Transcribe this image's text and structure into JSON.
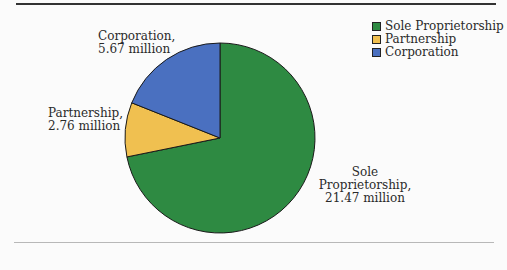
{
  "chart_data": {
    "type": "pie",
    "title": "",
    "categories": [
      "Sole Proprietorship",
      "Partnership",
      "Corporation"
    ],
    "values": [
      21.47,
      2.76,
      5.67
    ],
    "units": "million",
    "colors": [
      "#2e8a42",
      "#f0c050",
      "#4a70c0"
    ],
    "legend_position": "top-right",
    "start_angle_deg": 0,
    "direction": "clockwise"
  },
  "labels": {
    "corporation": [
      "Corporation,",
      "5.67 million"
    ],
    "partnership": [
      "Partnership,",
      "2.76 million"
    ],
    "sole": [
      "Sole",
      "Proprietorship,",
      "21.47 million"
    ]
  },
  "legend": [
    {
      "label": "Sole Proprietorship",
      "color": "#2e8a42"
    },
    {
      "label": "Partnership",
      "color": "#f0c050"
    },
    {
      "label": "Corporation",
      "color": "#4a70c0"
    }
  ]
}
